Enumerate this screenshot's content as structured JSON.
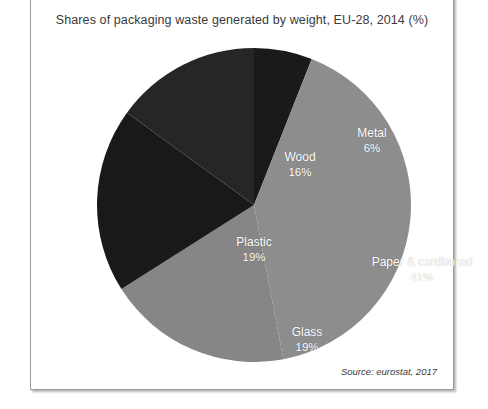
{
  "figure": {
    "title": "Shares of packaging waste generated by weight, EU-28, 2014 (%)",
    "source": "Source: eurostat, 2017"
  },
  "chart_data": {
    "type": "pie",
    "title": "Shares of packaging waste generated by weight, EU-28, 2014 (%)",
    "unit": "%",
    "start_angle_deg": 0,
    "direction": "clockwise",
    "legend": "none (direct slice labels)",
    "categories": [
      "Metal",
      "Paper & cardborad",
      "Glass",
      "Plastic",
      "Wood"
    ],
    "values": [
      6,
      41,
      19,
      19,
      16
    ],
    "slices": [
      {
        "label": "Metal",
        "value": 6,
        "value_text": "6%",
        "color": "#1a1a1a",
        "start_deg": 0.0,
        "end_deg": 21.6,
        "label_x": 277,
        "label_y": 93
      },
      {
        "label": "Paper & cardborad",
        "value": 41,
        "value_text": "41%",
        "color": "#8d8d8d",
        "start_deg": 21.6,
        "end_deg": 169.2,
        "label_x": 327,
        "label_y": 222
      },
      {
        "label": "Glass",
        "value": 19,
        "value_text": "19%",
        "color": "#868686",
        "start_deg": 169.2,
        "end_deg": 237.6,
        "label_x": 212,
        "label_y": 292
      },
      {
        "label": "Plastic",
        "value": 19,
        "value_text": "19%",
        "color": "#191919",
        "start_deg": 237.6,
        "end_deg": 306.0,
        "label_x": 159,
        "label_y": 202
      },
      {
        "label": "Wood",
        "value": 16,
        "value_text": "16%",
        "color": "#262626",
        "start_deg": 306.0,
        "end_deg": 360.0,
        "label_x": 205,
        "label_y": 117
      }
    ]
  }
}
